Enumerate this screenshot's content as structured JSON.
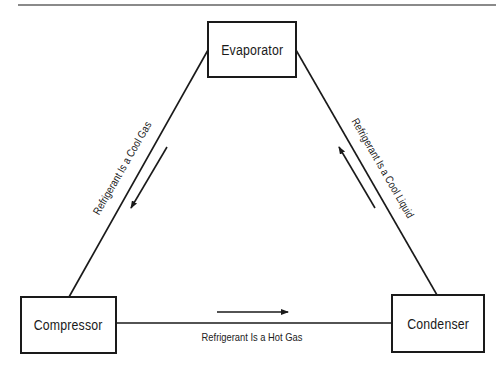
{
  "diagram": {
    "type": "refrigeration-cycle",
    "nodes": {
      "evaporator": "Evaporator",
      "compressor": "Compressor",
      "condenser": "Condenser"
    },
    "edges": {
      "compressor_to_condenser": "Refrigerant Is a Hot Gas",
      "condenser_to_evaporator": "Refrigerant Is a Cool Liquid",
      "evaporator_to_compressor": "Refrigerant Is a Cool Gas"
    },
    "colors": {
      "stroke": "#1a1a1a",
      "background": "#ffffff",
      "rule": "#8a8a8a"
    }
  }
}
